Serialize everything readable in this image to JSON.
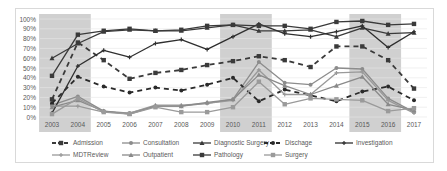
{
  "chart_data": {
    "type": "line",
    "title": "",
    "xlabel": "",
    "ylabel": "",
    "ylim": [
      0,
      100
    ],
    "y_ticks": [
      "0%",
      "10%",
      "20%",
      "30%",
      "40%",
      "50%",
      "60%",
      "70%",
      "80%",
      "90%",
      "100%"
    ],
    "categories": [
      "2003",
      "2004",
      "2005",
      "2006",
      "2007",
      "2008",
      "2009",
      "2010",
      "2011",
      "2012",
      "2013",
      "2014",
      "2015",
      "2016",
      "2017"
    ],
    "shaded_ranges": [
      [
        "2003",
        "2004"
      ],
      [
        "2010",
        "2011"
      ],
      [
        "2015",
        "2016"
      ]
    ],
    "grid": true,
    "legend_position": "bottom",
    "series": [
      {
        "name": "Admission",
        "style": "dashed",
        "marker": "square",
        "color": "#3a3a3a",
        "values": [
          18,
          76,
          58,
          39,
          45,
          48,
          53,
          57,
          62,
          58,
          51,
          72,
          72,
          58,
          29
        ]
      },
      {
        "name": "Consultation",
        "style": "solid",
        "marker": "circle",
        "color": "#8c8c8c",
        "values": [
          12,
          21,
          6,
          4,
          11,
          11,
          14,
          18,
          56,
          35,
          33,
          50,
          49,
          19,
          5
        ]
      },
      {
        "name": "Diagnostic Surgery",
        "style": "solid",
        "marker": "triangle",
        "color": "#3a3a3a",
        "values": [
          60,
          75,
          87,
          89,
          88,
          88,
          91,
          94,
          88,
          88,
          89,
          82,
          91,
          85,
          86
        ]
      },
      {
        "name": "Dischage",
        "style": "dashed",
        "marker": "circle",
        "color": "#2a2a2a",
        "values": [
          14,
          41,
          31,
          25,
          30,
          27,
          33,
          40,
          16,
          28,
          22,
          16,
          26,
          31,
          17
        ]
      },
      {
        "name": "Investigation",
        "style": "solid",
        "marker": "plus",
        "color": "#2f2f2f",
        "values": [
          4,
          52,
          68,
          61,
          75,
          79,
          69,
          82,
          95,
          85,
          82,
          87,
          93,
          71,
          87
        ]
      },
      {
        "name": "MDTReview",
        "style": "solid",
        "marker": "plus",
        "color": "#999999",
        "values": [
          11,
          11,
          5,
          4,
          12,
          12,
          14,
          17,
          48,
          23,
          23,
          45,
          46,
          17,
          4
        ]
      },
      {
        "name": "Outpatient",
        "style": "solid",
        "marker": "triangle",
        "color": "#8a8a8a",
        "values": [
          10,
          17,
          6,
          3,
          11,
          11,
          15,
          18,
          43,
          32,
          23,
          32,
          41,
          13,
          7
        ]
      },
      {
        "name": "Pathology",
        "style": "solid",
        "marker": "square",
        "color": "#3a3a3a",
        "values": [
          42,
          84,
          88,
          90,
          88,
          89,
          93,
          94,
          93,
          93,
          90,
          97,
          98,
          94,
          95
        ]
      },
      {
        "name": "Surgery",
        "style": "solid",
        "marker": "square",
        "color": "#9a9a9a",
        "values": [
          3,
          19,
          5,
          3,
          10,
          5,
          5,
          10,
          36,
          13,
          19,
          18,
          17,
          6,
          9
        ]
      }
    ]
  },
  "colors": {
    "frame": "#d9d9d9",
    "grid": "#e6e6e6",
    "shade": "#c8c8c8",
    "text": "#595959"
  }
}
